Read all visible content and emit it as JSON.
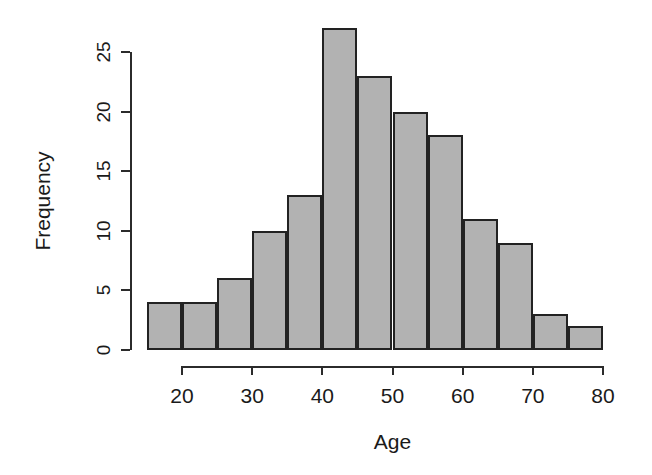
{
  "chart_data": {
    "type": "bar",
    "title": "",
    "subtitle": "",
    "xlabel": "Age",
    "ylabel": "Frequency",
    "bin_width": 5,
    "bin_edges": [
      15,
      20,
      25,
      30,
      35,
      40,
      45,
      50,
      55,
      60,
      65,
      70,
      75,
      80
    ],
    "categories": [
      "15-20",
      "20-25",
      "25-30",
      "30-35",
      "35-40",
      "40-45",
      "45-50",
      "50-55",
      "55-60",
      "60-65",
      "65-70",
      "70-75",
      "75-80"
    ],
    "values": [
      4,
      4,
      6,
      10,
      13,
      27,
      23,
      20,
      18,
      11,
      9,
      3,
      2
    ],
    "xlim": [
      15,
      80
    ],
    "ylim": [
      0,
      27
    ],
    "x_ticks": [
      20,
      30,
      40,
      50,
      60,
      70,
      80
    ],
    "x_tick_labels": [
      "20",
      "30",
      "40",
      "50",
      "60",
      "70",
      "80"
    ],
    "y_ticks": [
      0,
      5,
      10,
      15,
      20,
      25
    ],
    "y_tick_labels": [
      "0",
      "5",
      "10",
      "15",
      "20",
      "25"
    ],
    "y_axis_range": [
      0,
      25
    ],
    "grid": false,
    "legend": false,
    "bar_fill_color": "#b2b2b2",
    "bar_border_color": "#222222",
    "axis_color": "#2b2b2b",
    "background_color": "#ffffff"
  },
  "plot": {
    "x_axis_title": "Age",
    "y_axis_title": "Frequency"
  }
}
